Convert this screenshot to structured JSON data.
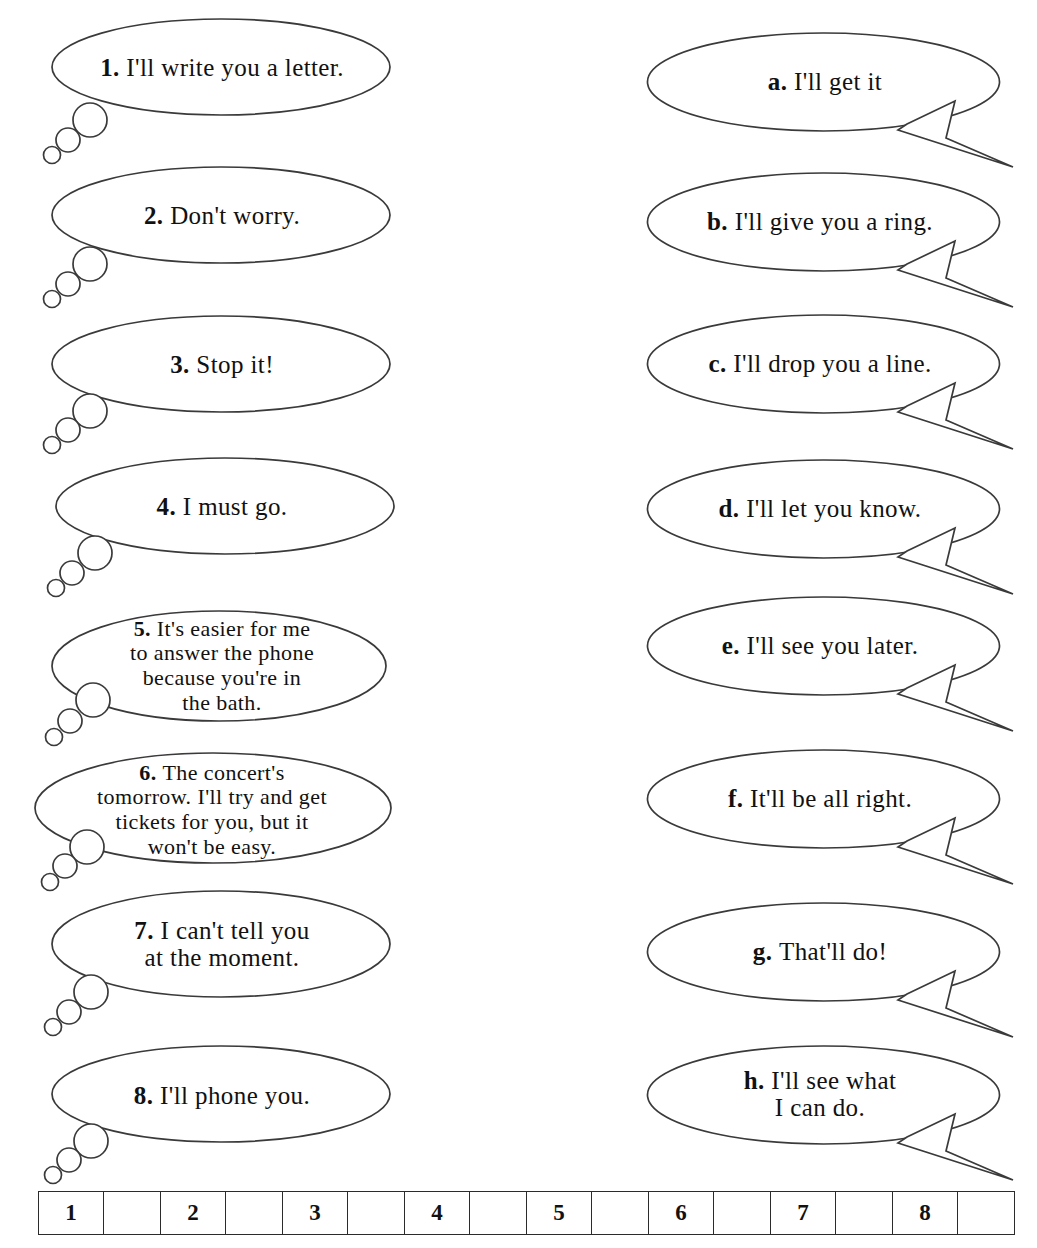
{
  "worksheet": {
    "title": "Matching exercise: thought bubbles and replies",
    "columns": {
      "left_label": "numbered-statements",
      "right_label": "lettered-replies"
    }
  },
  "left_bubbles": [
    {
      "marker": "1.",
      "text": "I'll write you a letter.",
      "lines": [
        "I'll write you a letter."
      ]
    },
    {
      "marker": "2.",
      "text": "Don't worry.",
      "lines": [
        "Don't worry."
      ]
    },
    {
      "marker": "3.",
      "text": "Stop it!",
      "lines": [
        "Stop it!"
      ]
    },
    {
      "marker": "4.",
      "text": "I must go.",
      "lines": [
        "I must go."
      ]
    },
    {
      "marker": "5.",
      "text": "It's easier for me to answer the phone because you're in the bath.",
      "lines": [
        "It's easier for me",
        "to answer the phone",
        "because you're in",
        "the bath."
      ]
    },
    {
      "marker": "6.",
      "text": "The concert's tomorrow. I'll try and get tickets for you, but it won't be easy.",
      "lines": [
        "The concert's",
        "tomorrow. I'll try and get",
        "tickets for you, but it",
        "won't be easy."
      ]
    },
    {
      "marker": "7.",
      "text": "I can't tell you at the moment.",
      "lines": [
        "I can't tell you",
        "at the moment."
      ]
    },
    {
      "marker": "8.",
      "text": "I'll phone you.",
      "lines": [
        "I'll phone you."
      ]
    }
  ],
  "right_bubbles": [
    {
      "marker": "a.",
      "text": "I'll get it",
      "lines": [
        "I'll get it"
      ]
    },
    {
      "marker": "b.",
      "text": "I'll give you a ring.",
      "lines": [
        "I'll give you a ring."
      ]
    },
    {
      "marker": "c.",
      "text": "I'll drop you a line.",
      "lines": [
        "I'll drop you a line."
      ]
    },
    {
      "marker": "d.",
      "text": "I'll let you know.",
      "lines": [
        "I'll let you know."
      ]
    },
    {
      "marker": "e.",
      "text": "I'll see you later.",
      "lines": [
        "I'll see you later."
      ]
    },
    {
      "marker": "f.",
      "text": "It'll be all right.",
      "lines": [
        "It'll be all right."
      ]
    },
    {
      "marker": "g.",
      "text": "That'll do!",
      "lines": [
        "That'll do!"
      ]
    },
    {
      "marker": "h.",
      "text": "I'll see what I can do.",
      "lines": [
        "I'll see what",
        "I can do."
      ]
    }
  ],
  "answer_table": {
    "cells": [
      {
        "type": "number",
        "value": "1"
      },
      {
        "type": "answer",
        "value": ""
      },
      {
        "type": "number",
        "value": "2"
      },
      {
        "type": "answer",
        "value": ""
      },
      {
        "type": "number",
        "value": "3"
      },
      {
        "type": "answer",
        "value": ""
      },
      {
        "type": "number",
        "value": "4"
      },
      {
        "type": "answer",
        "value": ""
      },
      {
        "type": "number",
        "value": "5"
      },
      {
        "type": "answer",
        "value": ""
      },
      {
        "type": "number",
        "value": "6"
      },
      {
        "type": "answer",
        "value": ""
      },
      {
        "type": "number",
        "value": "7"
      },
      {
        "type": "answer",
        "value": ""
      },
      {
        "type": "number",
        "value": "8"
      },
      {
        "type": "answer",
        "value": ""
      }
    ]
  },
  "colors": {
    "background": "#ffffff",
    "ink": "#1a1a1a",
    "stroke": "#3a3a3a",
    "table_border": "#2b2b2b"
  }
}
